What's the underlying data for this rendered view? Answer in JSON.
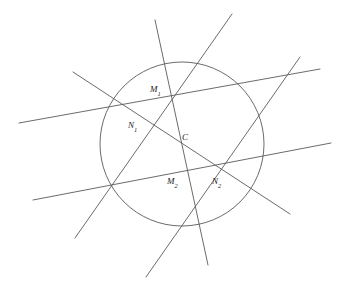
{
  "figure": {
    "canvas": {
      "width": 347,
      "height": 293,
      "background": "#ffffff"
    },
    "stroke_color": "#5a5a5a",
    "label_color": "#1a1a1a",
    "circle": {
      "name": "main-circle",
      "cx": 182,
      "cy": 144,
      "r": 82
    },
    "lines": [
      {
        "name": "secant-upper-horizontal",
        "x1": 19,
        "y1": 123,
        "x2": 320,
        "y2": 69
      },
      {
        "name": "secant-lower-horizontal",
        "x1": 33,
        "y1": 200,
        "x2": 331,
        "y2": 143
      },
      {
        "name": "secant-upper-left-diagonal",
        "x1": 73,
        "y1": 72,
        "x2": 290,
        "y2": 214
      },
      {
        "name": "secant-lower-left-diagonal",
        "x1": 75,
        "y1": 238,
        "x2": 232,
        "y2": 14
      },
      {
        "name": "secant-steep-left",
        "x1": 155,
        "y1": 20,
        "x2": 208,
        "y2": 265
      },
      {
        "name": "secant-steep-right",
        "x1": 146,
        "y1": 277,
        "x2": 300,
        "y2": 57
      }
    ],
    "labels": [
      {
        "name": "label-M1",
        "base": "M",
        "subscript": "1",
        "x": 150,
        "y": 92
      },
      {
        "name": "label-N1",
        "base": "N",
        "subscript": "1",
        "x": 128,
        "y": 128
      },
      {
        "name": "label-C",
        "base": "C",
        "subscript": "",
        "x": 182,
        "y": 140
      },
      {
        "name": "label-M2",
        "base": "M",
        "subscript": "2",
        "x": 167,
        "y": 184
      },
      {
        "name": "label-N2",
        "base": "N",
        "subscript": "2",
        "x": 212,
        "y": 184
      }
    ]
  }
}
